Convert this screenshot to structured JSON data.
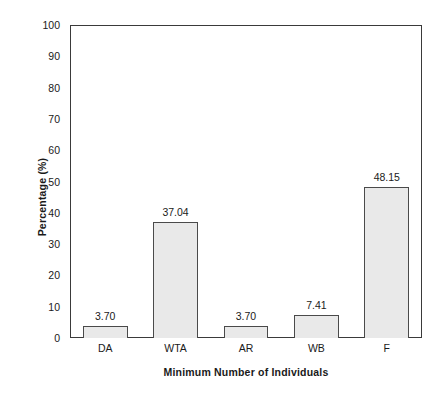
{
  "chart_data": {
    "type": "bar",
    "title": "",
    "subtitle": "",
    "xlabel": "Minimum Number of Individuals",
    "ylabel": "Percentage (%)",
    "categories": [
      "DA",
      "WTA",
      "AR",
      "WB",
      "F"
    ],
    "values": [
      3.7,
      37.04,
      3.7,
      7.41,
      48.15
    ],
    "value_labels": [
      "3.70",
      "37.04",
      "3.70",
      "7.41",
      "48.15"
    ],
    "ylim": [
      0,
      100
    ],
    "ytick_labels": [
      "0",
      "10",
      "20",
      "30",
      "40",
      "50",
      "60",
      "70",
      "80",
      "90",
      "100"
    ],
    "ytick_values": [
      0,
      10,
      20,
      30,
      40,
      50,
      60,
      70,
      80,
      90,
      100
    ],
    "grid": false,
    "legend": null,
    "legend_position": "none",
    "bar_fill_color": "#e9e9e9",
    "bar_edge_color": "#4a4a4a",
    "axis_color": "#3a3a3a",
    "background_color": "#ffffff",
    "text_color": "#1a1a1a"
  }
}
